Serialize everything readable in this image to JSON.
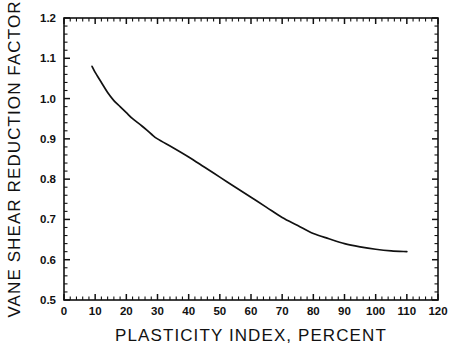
{
  "chart_data": {
    "type": "line",
    "title": "",
    "subtitle": "",
    "xlabel": "PLASTICITY INDEX, PERCENT",
    "ylabel": "VANE SHEAR REDUCTION FACTOR",
    "xlim": [
      0,
      120
    ],
    "ylim": [
      0.5,
      1.2
    ],
    "xticks": [
      0,
      10,
      20,
      30,
      40,
      50,
      60,
      70,
      80,
      90,
      100,
      110,
      120
    ],
    "xtick_labels": [
      "0",
      "10",
      "20",
      "30",
      "40",
      "50",
      "60",
      "70",
      "80",
      "90",
      "100",
      "110",
      "120"
    ],
    "yticks": [
      0.5,
      0.6,
      0.7,
      0.8,
      0.9,
      1.0,
      1.1,
      1.2
    ],
    "ytick_labels": [
      "0.5",
      "0.6",
      "0.7",
      "0.8",
      "0.9",
      "1.0",
      "1.1",
      "1.2"
    ],
    "x_minor_tick_step": 2,
    "y_minor_tick_step": 0.02,
    "grid": false,
    "legend": false,
    "legend_position": "none",
    "series": [
      {
        "name": "Vane shear correction curve",
        "color": "#111111",
        "x": [
          9,
          10,
          12,
          14,
          16,
          18,
          20,
          22,
          25,
          28,
          30,
          35,
          40,
          45,
          50,
          55,
          60,
          65,
          70,
          75,
          80,
          85,
          90,
          95,
          100,
          105,
          110
        ],
        "values": [
          1.08,
          1.065,
          1.04,
          1.015,
          0.995,
          0.98,
          0.965,
          0.95,
          0.932,
          0.912,
          0.9,
          0.878,
          0.855,
          0.83,
          0.805,
          0.78,
          0.755,
          0.73,
          0.705,
          0.685,
          0.665,
          0.652,
          0.64,
          0.632,
          0.626,
          0.622,
          0.62
        ]
      }
    ]
  },
  "figure": {
    "background_color": "#ffffff",
    "axis_color": "#111111",
    "curve_color": "#111111"
  }
}
